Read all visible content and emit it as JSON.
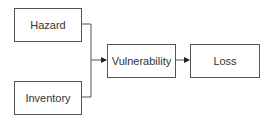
{
  "diagram": {
    "nodes": [
      {
        "id": "hazard",
        "label": "Hazard"
      },
      {
        "id": "inventory",
        "label": "Inventory"
      },
      {
        "id": "vulnerability",
        "label": "Vulnerability"
      },
      {
        "id": "loss",
        "label": "Loss"
      }
    ],
    "edges": [
      {
        "from": "hazard",
        "to": "vulnerability"
      },
      {
        "from": "inventory",
        "to": "vulnerability"
      },
      {
        "from": "vulnerability",
        "to": "loss"
      }
    ],
    "colors": {
      "stroke": "#555555",
      "text": "#333333",
      "background": "#ffffff"
    }
  }
}
